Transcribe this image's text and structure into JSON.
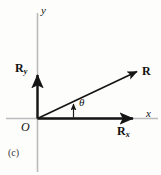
{
  "figure": {
    "caption": "(c)",
    "type": "vector-resolution-diagram",
    "colors": {
      "background": "#fdfdfc",
      "axis_line": "#b9b9b9",
      "vector": "#151515",
      "text": "#111111"
    },
    "axes": {
      "x_label": "x",
      "y_label": "y",
      "origin_label": "O",
      "x_axis_from": [
        37,
        118
      ],
      "x_axis_to": [
        139,
        118
      ],
      "y_axis_from": [
        37,
        118
      ],
      "y_axis_to": [
        37,
        14
      ]
    },
    "vectors": [
      {
        "name": "resultant",
        "label": "R",
        "label_sub": "",
        "from": [
          37,
          118
        ],
        "to": [
          141,
          69
        ],
        "label_pos": [
          143,
          72
        ]
      },
      {
        "name": "x-component",
        "label": "R",
        "label_sub": "x",
        "from": [
          37,
          118
        ],
        "to": [
          137,
          118
        ],
        "label_pos": [
          118,
          127
        ]
      },
      {
        "name": "y-component",
        "label": "R",
        "label_sub": "y",
        "from": [
          37,
          118
        ],
        "to": [
          37,
          71
        ],
        "label_pos": [
          16,
          66
        ]
      }
    ],
    "angle": {
      "symbol": "θ",
      "label_pos": [
        79,
        100
      ],
      "marker_from": [
        73,
        117
      ],
      "marker_to": [
        73,
        101
      ]
    }
  }
}
